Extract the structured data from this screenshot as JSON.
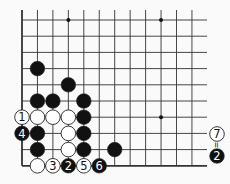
{
  "diagram": {
    "type": "go-board-fragment",
    "grid": {
      "x0": 22,
      "dx": 15.45,
      "cols": 12,
      "y0": 20,
      "dy": 16.2,
      "rows": 10,
      "top_extend": 10,
      "right_extend": 207,
      "line_color": "#333333",
      "edge_width": 1.8,
      "line_width": 0.9,
      "left_edge": true,
      "bottom_edge": true
    },
    "star_points": [
      [
        3,
        0
      ],
      [
        9,
        0
      ],
      [
        9,
        6
      ]
    ],
    "stones": [
      {
        "col": 1,
        "row": 3,
        "color": "black",
        "label": ""
      },
      {
        "col": 3,
        "row": 4,
        "color": "black",
        "label": ""
      },
      {
        "col": 1,
        "row": 5,
        "color": "black",
        "label": ""
      },
      {
        "col": 2,
        "row": 5,
        "color": "black",
        "label": ""
      },
      {
        "col": 4,
        "row": 5,
        "color": "black",
        "label": ""
      },
      {
        "col": 0,
        "row": 6,
        "color": "white",
        "label": "1"
      },
      {
        "col": 1,
        "row": 6,
        "color": "white",
        "label": ""
      },
      {
        "col": 2,
        "row": 6,
        "color": "white",
        "label": ""
      },
      {
        "col": 3,
        "row": 6,
        "color": "white",
        "label": ""
      },
      {
        "col": 4,
        "row": 6,
        "color": "black",
        "label": ""
      },
      {
        "col": 0,
        "row": 7,
        "color": "black",
        "label": "4"
      },
      {
        "col": 1,
        "row": 7,
        "color": "black",
        "label": ""
      },
      {
        "col": 3,
        "row": 7,
        "color": "white",
        "label": ""
      },
      {
        "col": 4,
        "row": 7,
        "color": "black",
        "label": ""
      },
      {
        "col": 1,
        "row": 8,
        "color": "black",
        "label": ""
      },
      {
        "col": 3,
        "row": 8,
        "color": "white",
        "label": ""
      },
      {
        "col": 4,
        "row": 8,
        "color": "black",
        "label": ""
      },
      {
        "col": 6,
        "row": 8,
        "color": "black",
        "label": ""
      },
      {
        "col": 1,
        "row": 9,
        "color": "white",
        "label": ""
      },
      {
        "col": 2,
        "row": 9,
        "color": "white",
        "label": "3"
      },
      {
        "col": 3,
        "row": 9,
        "color": "black",
        "label": "2"
      },
      {
        "col": 4,
        "row": 9,
        "color": "white",
        "label": "5"
      },
      {
        "col": 5,
        "row": 9,
        "color": "black",
        "label": "6"
      }
    ],
    "annotation": {
      "x": 217,
      "top_stone": {
        "color": "white",
        "label": "7",
        "y": 134
      },
      "equals": "=",
      "equals_y": 145,
      "bottom_stone": {
        "color": "black",
        "label": "2",
        "y": 156
      }
    },
    "colors": {
      "black": "#111111",
      "white": "#ffffff",
      "stroke": "#222222",
      "background": "#fafafa"
    }
  }
}
